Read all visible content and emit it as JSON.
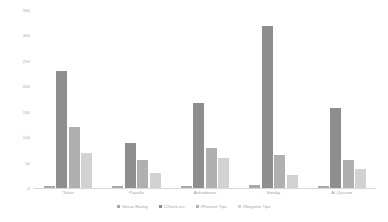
{
  "chart_data": {
    "type": "bar",
    "title": "",
    "xlabel": "",
    "ylabel": "",
    "ylim": [
      0,
      350
    ],
    "yticks": [
      0,
      50,
      100,
      150,
      200,
      250,
      300,
      350
    ],
    "ytick_labels": [
      "0",
      "50",
      "100",
      "150",
      "200",
      "250",
      "300",
      "350"
    ],
    "grid": false,
    "legend_position": "bottom",
    "categories": [
      "Tahat",
      "Pazalla",
      "Ashadenos",
      "Steaky",
      "Al-Qaisum"
    ],
    "series": [
      {
        "name": "Venue Rating",
        "color": "#a8a8a8",
        "values": [
          4,
          4,
          4,
          5,
          4
        ]
      },
      {
        "name": "#Check-ins",
        "color": "#8e8e8e",
        "values": [
          230,
          88,
          168,
          318,
          158
        ]
      },
      {
        "name": "#Positive Tips",
        "color": "#b0b0b0",
        "values": [
          120,
          55,
          78,
          65,
          55
        ]
      },
      {
        "name": "#Negative Tips",
        "color": "#d2d2d2",
        "values": [
          68,
          30,
          60,
          25,
          38
        ]
      }
    ]
  }
}
